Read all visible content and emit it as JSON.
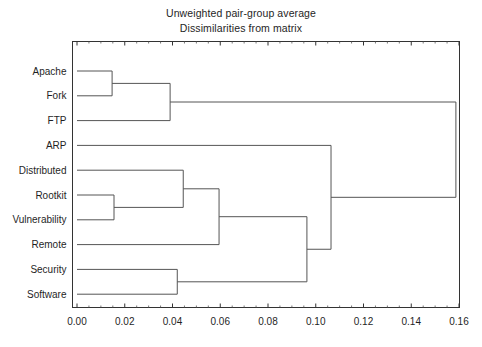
{
  "figure": {
    "title_lines": [
      "Unweighted pair-group average",
      "Dissimilarities from matrix"
    ],
    "background_color": "#ffffff",
    "line_color": "#555555",
    "axis_color": "#333333"
  },
  "chart_data": {
    "type": "dendrogram",
    "title": "Unweighted pair-group average",
    "subtitle": "Dissimilarities from matrix",
    "xlabel": "",
    "ylabel": "",
    "xlim": [
      0.0,
      0.16
    ],
    "xticks": [
      0.0,
      0.02,
      0.04,
      0.06,
      0.08,
      0.1,
      0.12,
      0.14,
      0.16
    ],
    "xtick_labels": [
      "0.00",
      "0.02",
      "0.04",
      "0.06",
      "0.08",
      "0.10",
      "0.12",
      "0.14",
      "0.16"
    ],
    "grid": false,
    "orientation": "horizontal",
    "linkage_method": "UPGMA",
    "distance_metric": "dissimilarity",
    "leaves": [
      "Apache",
      "Fork",
      "FTP",
      "ARP",
      "Distributed",
      "Rootkit",
      "Vulnerability",
      "Remote",
      "Security",
      "Software"
    ],
    "merges": [
      {
        "id": "n1",
        "children": [
          "Apache",
          "Fork"
        ],
        "height": 0.0147
      },
      {
        "id": "n2",
        "children": [
          "Rootkit",
          "Vulnerability"
        ],
        "height": 0.0155
      },
      {
        "id": "n3",
        "children": [
          "n1",
          "FTP"
        ],
        "height": 0.039
      },
      {
        "id": "n4",
        "children": [
          "Security",
          "Software"
        ],
        "height": 0.042
      },
      {
        "id": "n5",
        "children": [
          "Distributed",
          "n2"
        ],
        "height": 0.0445
      },
      {
        "id": "n6",
        "children": [
          "n5",
          "Remote"
        ],
        "height": 0.0595
      },
      {
        "id": "n7",
        "children": [
          "n6",
          "n4"
        ],
        "height": 0.0963
      },
      {
        "id": "n8",
        "children": [
          "ARP",
          "n7"
        ],
        "height": 0.1064
      },
      {
        "id": "n9",
        "children": [
          "n3",
          "n8"
        ],
        "height": 0.1587
      }
    ]
  },
  "axis": {
    "tick_labels": [
      "0.00",
      "0.02",
      "0.04",
      "0.06",
      "0.08",
      "0.10",
      "0.12",
      "0.14",
      "0.16"
    ]
  },
  "leaf_labels": [
    "Apache",
    "Fork",
    "FTP",
    "ARP",
    "Distributed",
    "Rootkit",
    "Vulnerability",
    "Remote",
    "Security",
    "Software"
  ]
}
